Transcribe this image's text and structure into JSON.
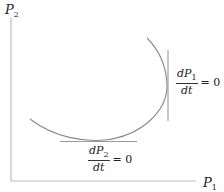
{
  "diagram": {
    "type": "phase-plane",
    "axes": {
      "y_label": {
        "base": "P",
        "sub": "2"
      },
      "x_label": {
        "base": "P",
        "sub": "1"
      }
    },
    "nullclines": [
      {
        "id": "p1",
        "num": {
          "d": "d",
          "base": "P",
          "sub": "1"
        },
        "den": "dt",
        "eq": "= 0",
        "orientation": "vertical"
      },
      {
        "id": "p2",
        "num": {
          "d": "d",
          "base": "P",
          "sub": "2"
        },
        "den": "dt",
        "eq": "= 0",
        "orientation": "horizontal"
      }
    ],
    "colors": {
      "axis": "#b8b8b8",
      "curve": "#8a8a8a",
      "tangent": "#999999",
      "text": "#222222"
    }
  }
}
